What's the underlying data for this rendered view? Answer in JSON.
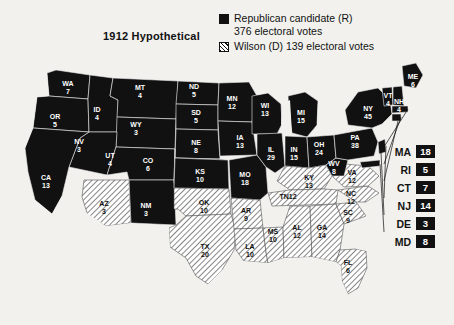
{
  "title": "1912 Hypothetical",
  "legend": {
    "republican": {
      "label": "Republican candidate (R)",
      "votes_line": "376 electoral votes",
      "swatch": "black-square-icon",
      "color": "#111111"
    },
    "democrat": {
      "label": "Wilson (D) 139 electoral votes",
      "swatch": "hatched-square-icon",
      "color": "#ffffff"
    }
  },
  "side_list": [
    {
      "abbr": "MA",
      "votes": "18",
      "party": "rep"
    },
    {
      "abbr": "RI",
      "votes": "5",
      "party": "rep"
    },
    {
      "abbr": "CT",
      "votes": "7",
      "party": "rep"
    },
    {
      "abbr": "NJ",
      "votes": "14",
      "party": "rep"
    },
    {
      "abbr": "DE",
      "votes": "3",
      "party": "rep"
    },
    {
      "abbr": "MD",
      "votes": "8",
      "party": "rep"
    }
  ],
  "chart_data": {
    "type": "map",
    "title": "1912 Hypothetical",
    "legend_entries": [
      {
        "name": "Republican candidate (R)",
        "total": 376,
        "style": "solid-black"
      },
      {
        "name": "Wilson (D)",
        "total": 139,
        "style": "diagonal-hatch"
      }
    ],
    "totals": {
      "republican": 376,
      "democrat": 139
    },
    "states": [
      {
        "abbr": "WA",
        "votes": 7,
        "party": "rep",
        "x": 68,
        "y": 86
      },
      {
        "abbr": "OR",
        "votes": 5,
        "party": "rep",
        "x": 55,
        "y": 119
      },
      {
        "abbr": "ID",
        "votes": 4,
        "party": "rep",
        "x": 97,
        "y": 112
      },
      {
        "abbr": "MT",
        "votes": 4,
        "party": "rep",
        "x": 140,
        "y": 90
      },
      {
        "abbr": "ND",
        "votes": 5,
        "party": "rep",
        "x": 194,
        "y": 89
      },
      {
        "abbr": "SD",
        "votes": 5,
        "party": "rep",
        "x": 196,
        "y": 115
      },
      {
        "abbr": "NE",
        "votes": 8,
        "party": "rep",
        "x": 196,
        "y": 145
      },
      {
        "abbr": "WY",
        "votes": 3,
        "party": "rep",
        "x": 136,
        "y": 127
      },
      {
        "abbr": "CO",
        "votes": 6,
        "party": "rep",
        "x": 148,
        "y": 163
      },
      {
        "abbr": "NV",
        "votes": 3,
        "party": "rep",
        "x": 79,
        "y": 144
      },
      {
        "abbr": "UT",
        "votes": 4,
        "party": "rep",
        "x": 110,
        "y": 158
      },
      {
        "abbr": "CA",
        "votes": 13,
        "party": "rep",
        "x": 46,
        "y": 180
      },
      {
        "abbr": "AZ",
        "votes": 3,
        "party": "dem",
        "x": 104,
        "y": 206
      },
      {
        "abbr": "NM",
        "votes": 3,
        "party": "rep",
        "x": 146,
        "y": 208
      },
      {
        "abbr": "KS",
        "votes": 10,
        "party": "rep",
        "x": 200,
        "y": 174
      },
      {
        "abbr": "OK",
        "votes": 10,
        "party": "dem",
        "x": 204,
        "y": 205
      },
      {
        "abbr": "TX",
        "votes": 20,
        "party": "dem",
        "x": 205,
        "y": 249
      },
      {
        "abbr": "MN",
        "votes": 12,
        "party": "rep",
        "x": 232,
        "y": 101
      },
      {
        "abbr": "IA",
        "votes": 13,
        "party": "rep",
        "x": 240,
        "y": 140
      },
      {
        "abbr": "MO",
        "votes": 18,
        "party": "rep",
        "x": 245,
        "y": 177
      },
      {
        "abbr": "AR",
        "votes": 9,
        "party": "dem",
        "x": 246,
        "y": 213
      },
      {
        "abbr": "LA",
        "votes": 10,
        "party": "dem",
        "x": 250,
        "y": 249
      },
      {
        "abbr": "MS",
        "votes": 10,
        "party": "dem",
        "x": 273,
        "y": 234
      },
      {
        "abbr": "WI",
        "votes": 13,
        "party": "rep",
        "x": 265,
        "y": 108
      },
      {
        "abbr": "IL",
        "votes": 29,
        "party": "rep",
        "x": 271,
        "y": 152
      },
      {
        "abbr": "MI",
        "votes": 15,
        "party": "rep",
        "x": 301,
        "y": 115
      },
      {
        "abbr": "IN",
        "votes": 15,
        "party": "rep",
        "x": 294,
        "y": 152
      },
      {
        "abbr": "OH",
        "votes": 24,
        "party": "rep",
        "x": 319,
        "y": 147
      },
      {
        "abbr": "KY",
        "votes": 13,
        "party": "dem",
        "x": 309,
        "y": 180
      },
      {
        "abbr": "TN",
        "votes": 12,
        "party": "dem",
        "x": 288,
        "y": 199
      },
      {
        "abbr": "AL",
        "votes": 12,
        "party": "dem",
        "x": 297,
        "y": 230
      },
      {
        "abbr": "GA",
        "votes": 14,
        "party": "dem",
        "x": 322,
        "y": 230
      },
      {
        "abbr": "FL",
        "votes": 6,
        "party": "dem",
        "x": 348,
        "y": 265
      },
      {
        "abbr": "SC",
        "votes": 9,
        "party": "dem",
        "x": 348,
        "y": 215
      },
      {
        "abbr": "NC",
        "votes": 12,
        "party": "dem",
        "x": 351,
        "y": 196
      },
      {
        "abbr": "VA",
        "votes": 12,
        "party": "dem",
        "x": 352,
        "y": 175
      },
      {
        "abbr": "WV",
        "votes": 8,
        "party": "rep",
        "x": 334,
        "y": 166
      },
      {
        "abbr": "PA",
        "votes": 38,
        "party": "rep",
        "x": 355,
        "y": 140
      },
      {
        "abbr": "NY",
        "votes": 45,
        "party": "rep",
        "x": 368,
        "y": 111
      },
      {
        "abbr": "VT",
        "votes": 4,
        "party": "rep",
        "x": 388,
        "y": 98
      },
      {
        "abbr": "NH",
        "votes": 4,
        "party": "rep",
        "x": 399,
        "y": 104
      },
      {
        "abbr": "ME",
        "votes": 6,
        "party": "rep",
        "x": 413,
        "y": 79
      },
      {
        "abbr": "MA",
        "votes": 18,
        "party": "rep",
        "x": 0,
        "y": 0
      },
      {
        "abbr": "RI",
        "votes": 5,
        "party": "rep",
        "x": 0,
        "y": 0
      },
      {
        "abbr": "CT",
        "votes": 7,
        "party": "rep",
        "x": 0,
        "y": 0
      },
      {
        "abbr": "NJ",
        "votes": 14,
        "party": "rep",
        "x": 0,
        "y": 0
      },
      {
        "abbr": "DE",
        "votes": 3,
        "party": "rep",
        "x": 0,
        "y": 0
      },
      {
        "abbr": "MD",
        "votes": 8,
        "party": "rep",
        "x": 0,
        "y": 0
      }
    ]
  }
}
